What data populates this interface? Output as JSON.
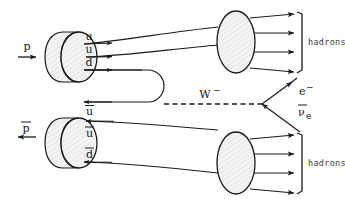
{
  "diagram": {
    "background_color": "#ffffff",
    "line_color": "#1a1a1a",
    "blob_fill": "#f2f2f2",
    "incoming": {
      "proton": {
        "label": "p",
        "overbar": false,
        "arrow_direction": "right",
        "quarks": [
          {
            "label": "u",
            "overbar": false
          },
          {
            "label": "u",
            "overbar": false
          },
          {
            "label": "d",
            "overbar": false
          }
        ]
      },
      "antiproton": {
        "label": "p",
        "overbar": true,
        "arrow_direction": "left",
        "quarks": [
          {
            "label": "u",
            "overbar": true
          },
          {
            "label": "u",
            "overbar": true
          },
          {
            "label": "d",
            "overbar": true
          }
        ]
      }
    },
    "boson": {
      "label": "W",
      "superscript": "−",
      "line_style": "dashed"
    },
    "decay_products": [
      {
        "label": "e",
        "superscript": "−",
        "overbar": false,
        "subscript": ""
      },
      {
        "label": "ν",
        "superscript": "",
        "overbar": true,
        "subscript": "e"
      }
    ],
    "hadron_groups": [
      {
        "label": "hadrons",
        "position": "top-right",
        "arrow_count": 4
      },
      {
        "label": "hadrons",
        "position": "bottom-right",
        "arrow_count": 4
      }
    ]
  }
}
